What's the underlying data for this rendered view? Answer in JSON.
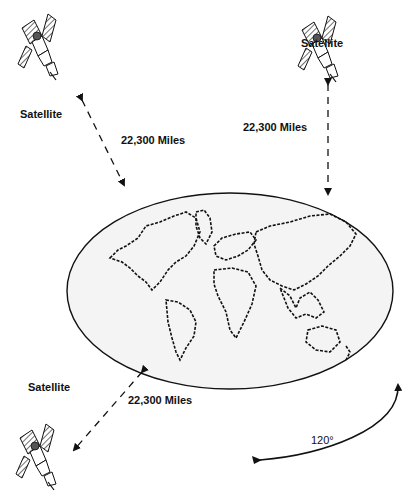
{
  "diagram": {
    "type": "geostationary-satellite-coverage",
    "satellites": [
      {
        "id": "top-left",
        "label": "Satellite",
        "distance_label": "22,300 Miles"
      },
      {
        "id": "top-right",
        "label": "Satellite",
        "distance_label": "22,300 Miles"
      },
      {
        "id": "bottom-left",
        "label": "Satellite",
        "distance_label": "22,300 Miles"
      }
    ],
    "earth": {
      "label": "world-map"
    },
    "separation_angle": "120°",
    "colors": {
      "ink": "#111111",
      "earth_fill": "#f4f4f4",
      "background": "#ffffff"
    }
  }
}
